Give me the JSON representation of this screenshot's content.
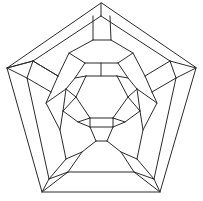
{
  "figure": {
    "name": "schlegel-diagram",
    "type": "planar-graph",
    "background_color": "#ffffff",
    "stroke_color": "#2b2b2b",
    "stroke_width": 1,
    "width": 203,
    "height": 201,
    "vertex_count": 60,
    "face_count": 32,
    "symmetry": "5-fold rotational"
  },
  "graph": {
    "vertices": [
      [
        101,
        3
      ],
      [
        7,
        68
      ],
      [
        196,
        68
      ],
      [
        42,
        192
      ],
      [
        160,
        192
      ],
      [
        101,
        16
      ],
      [
        32,
        66
      ],
      [
        170,
        66
      ],
      [
        56,
        176
      ],
      [
        146,
        176
      ],
      [
        93,
        16
      ],
      [
        109,
        16
      ],
      [
        33,
        60
      ],
      [
        27,
        78
      ],
      [
        176,
        78
      ],
      [
        170,
        60
      ],
      [
        48,
        180
      ],
      [
        68,
        172
      ],
      [
        134,
        172
      ],
      [
        154,
        180
      ],
      [
        92,
        40
      ],
      [
        111,
        40
      ],
      [
        58,
        76
      ],
      [
        52,
        92
      ],
      [
        151,
        92
      ],
      [
        145,
        76
      ],
      [
        67,
        159
      ],
      [
        82,
        151
      ],
      [
        121,
        151
      ],
      [
        136,
        159
      ],
      [
        70,
        53
      ],
      [
        132,
        53
      ],
      [
        47,
        103
      ],
      [
        60,
        130
      ],
      [
        143,
        130
      ],
      [
        156,
        103
      ],
      [
        76,
        145
      ],
      [
        96,
        140
      ],
      [
        107,
        140
      ],
      [
        127,
        145
      ],
      [
        85,
        63
      ],
      [
        118,
        63
      ],
      [
        66,
        89
      ],
      [
        63,
        111
      ],
      [
        140,
        111
      ],
      [
        137,
        89
      ],
      [
        85,
        132
      ],
      [
        101,
        126
      ],
      [
        118,
        132
      ],
      [
        77,
        122
      ],
      [
        86,
        75
      ],
      [
        117,
        75
      ],
      [
        75,
        96
      ],
      [
        88,
        118
      ],
      [
        115,
        118
      ],
      [
        128,
        96
      ],
      [
        101,
        108
      ],
      [
        93,
        120
      ],
      [
        110,
        120
      ],
      [
        101,
        86
      ]
    ],
    "edges_outer_pentagon": [
      [
        101,
        3,
        7,
        68
      ],
      [
        7,
        68,
        42,
        192
      ],
      [
        42,
        192,
        160,
        192
      ],
      [
        160,
        192,
        196,
        68
      ],
      [
        196,
        68,
        101,
        3
      ]
    ],
    "edges_second_pentagon": [
      [
        101,
        16,
        33,
        60
      ],
      [
        27,
        78,
        48,
        180
      ],
      [
        68,
        172,
        134,
        172
      ],
      [
        154,
        180,
        176,
        78
      ],
      [
        170,
        60,
        101,
        16
      ]
    ],
    "radial_spokes": [
      [
        101,
        3,
        101,
        16
      ],
      [
        7,
        68,
        33,
        60
      ],
      [
        7,
        68,
        27,
        78
      ],
      [
        42,
        192,
        48,
        180
      ],
      [
        42,
        192,
        68,
        172
      ],
      [
        160,
        192,
        134,
        172
      ],
      [
        160,
        192,
        154,
        180
      ],
      [
        196,
        68,
        176,
        78
      ],
      [
        196,
        68,
        170,
        60
      ]
    ],
    "mid_ring_edges": [
      [
        33,
        60,
        27,
        78
      ],
      [
        48,
        180,
        68,
        172
      ],
      [
        134,
        172,
        154,
        180
      ],
      [
        176,
        78,
        170,
        60
      ],
      [
        93,
        16,
        109,
        16
      ]
    ]
  },
  "chart_data": {
    "type": "graph",
    "nodes": 60,
    "edges": 90,
    "faces": 32,
    "layout": "planar, 5-fold symmetric",
    "note": "Nested pentagon rings connected by radial and zig-zag edges"
  }
}
